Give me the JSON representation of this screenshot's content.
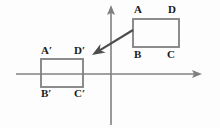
{
  "figure": {
    "background_color": "#fdfdfd",
    "line_color": "#808080",
    "label_color": "#1a1a1a",
    "axes": {
      "x_axis": {
        "name": "x-axis",
        "arrow": "right",
        "y": 74,
        "x_start": 16,
        "x_end": 202
      },
      "y_axis": {
        "name": "y-axis",
        "arrow": "up",
        "x": 111,
        "y_start": 125,
        "y_end": 5
      }
    },
    "shapes": [
      {
        "id": "preimage",
        "name": "rectangle-abcd",
        "x": 133,
        "y": 19,
        "width": 46,
        "height": 28,
        "vertices": [
          {
            "key": "A",
            "label": "A",
            "x": 134,
            "y": 4
          },
          {
            "key": "D",
            "label": "D",
            "x": 168,
            "y": 4
          },
          {
            "key": "B",
            "label": "B",
            "x": 134,
            "y": 49
          },
          {
            "key": "C",
            "label": "C",
            "x": 167,
            "y": 49
          }
        ]
      },
      {
        "id": "image",
        "name": "rectangle-a-prime-b-prime-c-prime-d-prime",
        "x": 41,
        "y": 59,
        "width": 42,
        "height": 28,
        "vertices": [
          {
            "key": "Aprime",
            "label": "A′",
            "x": 41,
            "y": 45
          },
          {
            "key": "Dprime",
            "label": "D′",
            "x": 74,
            "y": 45
          },
          {
            "key": "Bprime",
            "label": "B′",
            "x": 41,
            "y": 88
          },
          {
            "key": "Cprime",
            "label": "C′",
            "x": 74,
            "y": 88
          }
        ]
      }
    ],
    "translation_arrow": {
      "name": "translation-arrow",
      "from_x": 133,
      "from_y": 30,
      "to_x": 92,
      "to_y": 55
    }
  }
}
